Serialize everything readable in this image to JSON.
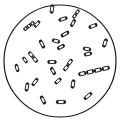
{
  "figure": {
    "title": "Rod-shaped bacteria with spores in microscope field",
    "background": "#ffffff",
    "ink": "#1a1a1a",
    "field": {
      "cx": 60,
      "cy": 61,
      "r": 56,
      "stroke": "#1a1a1a",
      "stroke_width": 1.2
    },
    "rods": [
      {
        "x": 52,
        "y": 9,
        "len": 9,
        "w": 3,
        "angle": -82,
        "cells": 1
      },
      {
        "x": 76,
        "y": 14,
        "len": 10,
        "w": 2.6,
        "angle": -55,
        "cells": 2
      },
      {
        "x": 29,
        "y": 26,
        "len": 13,
        "w": 3.2,
        "angle": -38,
        "cells": 3
      },
      {
        "x": 37,
        "y": 24,
        "len": 8,
        "w": 2.8,
        "angle": -50,
        "cells": 1
      },
      {
        "x": 63,
        "y": 19,
        "len": 9,
        "w": 2.8,
        "angle": -18,
        "cells": 1
      },
      {
        "x": 73,
        "y": 23,
        "len": 8,
        "w": 2.6,
        "angle": -60,
        "cells": 1
      },
      {
        "x": 93,
        "y": 26,
        "len": 9,
        "w": 3,
        "angle": -22,
        "cells": 1
      },
      {
        "x": 65,
        "y": 34,
        "len": 9,
        "w": 2.8,
        "angle": -30,
        "cells": 1
      },
      {
        "x": 56,
        "y": 41,
        "len": 8,
        "w": 3,
        "angle": 15,
        "cells": 1
      },
      {
        "x": 42,
        "y": 44,
        "len": 9,
        "w": 2.8,
        "angle": 62,
        "cells": 1
      },
      {
        "x": 61,
        "y": 47,
        "len": 8,
        "w": 2.8,
        "angle": -30,
        "cells": 1
      },
      {
        "x": 105,
        "y": 43,
        "len": 9,
        "w": 3,
        "angle": -70,
        "cells": 1
      },
      {
        "x": 87,
        "y": 49,
        "len": 8,
        "w": 3,
        "angle": 10,
        "cells": 1
      },
      {
        "x": 88,
        "y": 54,
        "len": 8,
        "w": 3,
        "angle": -12,
        "cells": 1
      },
      {
        "x": 33,
        "y": 57,
        "len": 13,
        "w": 3.2,
        "angle": 50,
        "cells": 2
      },
      {
        "x": 52,
        "y": 62,
        "len": 9,
        "w": 3,
        "angle": 2,
        "cells": 1
      },
      {
        "x": 68,
        "y": 65,
        "len": 14,
        "w": 3,
        "angle": -55,
        "cells": 2
      },
      {
        "x": 25,
        "y": 60,
        "len": 7,
        "w": 2.6,
        "angle": 55,
        "cells": 1
      },
      {
        "x": 17,
        "y": 68,
        "len": 8,
        "w": 2.6,
        "angle": 75,
        "cells": 1
      },
      {
        "x": 53,
        "y": 71,
        "len": 8,
        "w": 2.8,
        "angle": 60,
        "cells": 1
      },
      {
        "x": 94,
        "y": 71,
        "len": 32,
        "w": 3.4,
        "angle": -13,
        "cells": 4
      },
      {
        "x": 58,
        "y": 81,
        "len": 8,
        "w": 2.8,
        "angle": -40,
        "cells": 1
      },
      {
        "x": 73,
        "y": 84,
        "len": 9,
        "w": 3,
        "angle": -80,
        "cells": 1
      },
      {
        "x": 27,
        "y": 87,
        "len": 9,
        "w": 2.8,
        "angle": -80,
        "cells": 1
      },
      {
        "x": 35,
        "y": 82,
        "len": 9,
        "w": 2.8,
        "angle": -55,
        "cells": 1
      },
      {
        "x": 43,
        "y": 100,
        "len": 9,
        "w": 2.8,
        "angle": 62,
        "cells": 1
      },
      {
        "x": 61,
        "y": 102,
        "len": 10,
        "w": 3.2,
        "angle": 0,
        "cells": 1
      },
      {
        "x": 88,
        "y": 96,
        "len": 10,
        "w": 2.8,
        "angle": -40,
        "cells": 1
      }
    ]
  }
}
